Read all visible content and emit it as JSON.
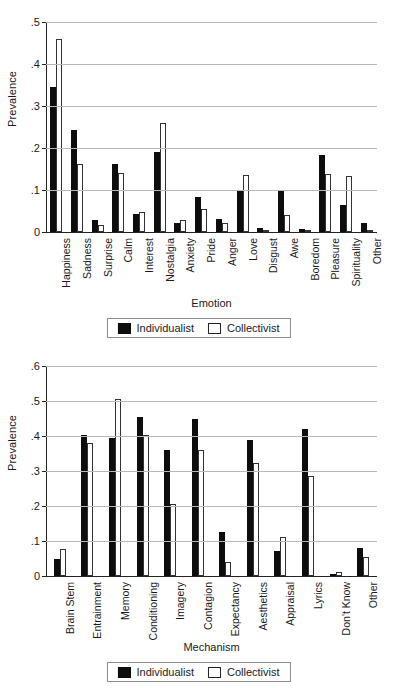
{
  "legend": {
    "individualist_label": "Individualist",
    "collectivist_label": "Collectivist",
    "individualist_color": "#0d0d0d",
    "collectivist_color": "#ffffff"
  },
  "chart_data": [
    {
      "type": "bar",
      "title": "",
      "xlabel": "Emotion",
      "ylabel": "Prevalence",
      "ylim": [
        0,
        0.5
      ],
      "yticks": [
        0,
        0.1,
        0.2,
        0.3,
        0.4,
        0.5
      ],
      "ytick_labels": [
        "0",
        ".1",
        ".2",
        ".3",
        ".4",
        ".5"
      ],
      "grid": true,
      "legend_position": "bottom-center",
      "categories": [
        "Happiness",
        "Sadness",
        "Surprise",
        "Calm",
        "Interest",
        "Nostalgia",
        "Anxiety",
        "Pride",
        "Anger",
        "Love",
        "Disgust",
        "Awe",
        "Boredom",
        "Pleasure",
        "Spirituality",
        "Other"
      ],
      "series": [
        {
          "name": "Individualist",
          "values": [
            0.345,
            0.242,
            0.028,
            0.161,
            0.043,
            0.191,
            0.021,
            0.084,
            0.03,
            0.097,
            0.009,
            0.097,
            0.006,
            0.184,
            0.065,
            0.021
          ]
        },
        {
          "name": "Collectivist",
          "values": [
            0.46,
            0.161,
            0.016,
            0.141,
            0.048,
            0.259,
            0.028,
            0.055,
            0.022,
            0.136,
            0.0,
            0.04,
            0.004,
            0.138,
            0.134,
            0.0
          ]
        }
      ]
    },
    {
      "type": "bar",
      "title": "",
      "xlabel": "Mechanism",
      "ylabel": "Prevalence",
      "ylim": [
        0,
        0.6
      ],
      "yticks": [
        0,
        0.1,
        0.2,
        0.3,
        0.4,
        0.5,
        0.6
      ],
      "ytick_labels": [
        "0",
        ".1",
        ".2",
        ".3",
        ".4",
        ".5",
        ".6"
      ],
      "grid": true,
      "legend_position": "bottom-center",
      "categories": [
        "Brain Stem",
        "Entrainment",
        "Memory",
        "Conditioning",
        "Imagery",
        "Contagion",
        "Expectancy",
        "Aesthetics",
        "Appraisal",
        "Lyrics",
        "Don't Know",
        "Other"
      ],
      "series": [
        {
          "name": "Individualist",
          "values": [
            0.048,
            0.403,
            0.394,
            0.454,
            0.359,
            0.45,
            0.127,
            0.389,
            0.072,
            0.419,
            0.005,
            0.079
          ]
        },
        {
          "name": "Collectivist",
          "values": [
            0.076,
            0.381,
            0.505,
            0.402,
            0.207,
            0.361,
            0.041,
            0.324,
            0.111,
            0.287,
            0.011,
            0.054
          ]
        }
      ]
    }
  ]
}
